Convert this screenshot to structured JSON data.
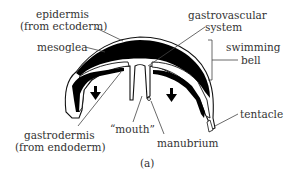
{
  "figure": {
    "panel_label": "(a)"
  },
  "labels": {
    "epidermis_line1": "epidermis",
    "epidermis_line2": "(from ectoderm)",
    "mesoglea": "mesoglea",
    "gastrovascular_line1": "gastrovascular",
    "gastrovascular_line2": "system",
    "swimming_bell_line1": "swimming",
    "swimming_bell_line2": "bell",
    "tentacle": "tentacle",
    "gastrodermis_line1": "gastrodermis",
    "gastrodermis_line2": "(from endoderm)",
    "mouth": "“mouth”",
    "manubrium": "manubrium"
  },
  "colors": {
    "mesoglea_fill": "#000000",
    "outline": "#111111",
    "background": "#ffffff",
    "text": "#333333"
  },
  "icons": {
    "arrows": [
      "down-arrow-icon",
      "down-arrow-icon"
    ]
  }
}
